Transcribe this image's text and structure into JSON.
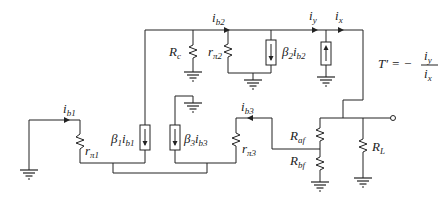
{
  "diagram": {
    "type": "small-signal feedback circuit",
    "labels": {
      "ib1": {
        "main": "i",
        "sub": "b1"
      },
      "rpi1": {
        "main": "r",
        "sub": "π1"
      },
      "beta1": {
        "main": "β",
        "sub1": "1",
        "mid": "i",
        "sub2": "b1"
      },
      "beta3": {
        "main": "β",
        "sub1": "3",
        "mid": "i",
        "sub2": "b3"
      },
      "rc": {
        "main": "R",
        "sub": "c"
      },
      "ib2": {
        "main": "i",
        "sub": "b2"
      },
      "rpi2": {
        "main": "r",
        "sub": "π2"
      },
      "beta2": {
        "main": "β",
        "sub1": "2",
        "mid": "i",
        "sub2": "b2"
      },
      "iy": {
        "main": "i",
        "sub": "y"
      },
      "ix": {
        "main": "i",
        "sub": "x"
      },
      "ib3": {
        "main": "i",
        "sub": "b3"
      },
      "rpi3": {
        "main": "r",
        "sub": "π3"
      },
      "raf": {
        "main": "R",
        "sub": "af"
      },
      "rbf": {
        "main": "R",
        "sub": "bf"
      },
      "rl": {
        "main": "R",
        "sub": "L"
      },
      "formula": {
        "lhs": "T′ = −",
        "num_main": "i",
        "num_sub": "y",
        "den_main": "i",
        "den_sub": "x"
      }
    }
  }
}
